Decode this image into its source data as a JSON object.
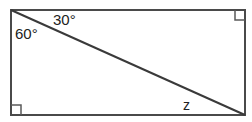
{
  "diagram": {
    "type": "rectangle-with-diagonal",
    "labels": {
      "angle_top": "30°",
      "angle_left": "60°",
      "unknown": "z"
    },
    "right_angle_marks": [
      "top-right",
      "bottom-left"
    ],
    "colors": {
      "stroke": "#4a4a4a",
      "background": "#ffffff",
      "text": "#222222"
    }
  }
}
